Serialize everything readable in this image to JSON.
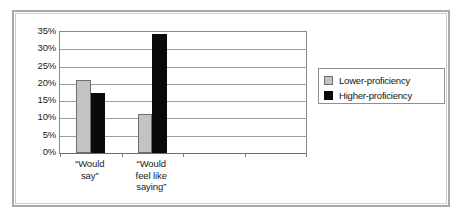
{
  "chart_data": {
    "type": "bar",
    "title": "",
    "xlabel": "",
    "ylabel": "",
    "categories": [
      "“Would\nsay”",
      "“Would\nfeel like\nsaying”"
    ],
    "series": [
      {
        "name": "Lower-proficiency",
        "color": "#c3c3c3",
        "values": [
          21.0,
          11.3
        ]
      },
      {
        "name": "Higher-proficiency",
        "color": "#0a0a0a",
        "values": [
          17.3,
          34.5
        ]
      }
    ],
    "ylim": [
      0,
      35
    ],
    "ytick_values": [
      0,
      5,
      10,
      15,
      20,
      25,
      30,
      35
    ],
    "ytick_labels": [
      "0%",
      "5%",
      "10%",
      "15%",
      "20%",
      "25%",
      "30%",
      "35%"
    ],
    "grid": true,
    "legend_position": "right",
    "category_slots": 4
  },
  "legend": {
    "items": [
      {
        "label": "Lower-proficiency",
        "swatch": "lower"
      },
      {
        "label": "Higher-proficiency",
        "swatch": "higher"
      }
    ]
  }
}
